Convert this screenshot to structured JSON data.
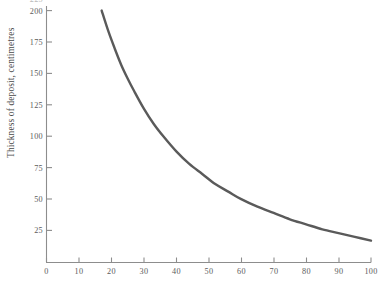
{
  "chart_data": {
    "type": "line",
    "title": "",
    "subtitle": "",
    "xlabel": "",
    "ylabel": "Thickness of deposit, centimetres",
    "xlim": [
      0,
      100
    ],
    "ylim": [
      0,
      200
    ],
    "xticks": [
      0,
      10,
      20,
      30,
      40,
      50,
      60,
      70,
      80,
      90,
      100
    ],
    "xticklabels": [
      "0",
      "10",
      "20",
      "30",
      "40",
      "50",
      "60",
      "70",
      "80",
      "90",
      "100"
    ],
    "yticks": [
      25,
      50,
      75,
      100,
      125,
      150,
      175,
      200
    ],
    "yticklabels": [
      "25",
      "50",
      "75",
      "100",
      "125",
      "150",
      "175",
      "200"
    ],
    "ytick_clipped_top": {
      "value": 225,
      "label": "225",
      "note": "partially cut off at top edge of image"
    },
    "grid": false,
    "legend": null,
    "annotations": [],
    "series": [
      {
        "name": "deposit thickness",
        "color": "#5a5a5a",
        "linewidth": 2.4,
        "x": [
          17,
          19,
          21,
          23,
          25,
          27,
          30,
          33,
          36,
          40,
          44,
          48,
          52,
          56,
          60,
          65,
          70,
          75,
          80,
          85,
          90,
          95,
          100
        ],
        "y": [
          200,
          184,
          170,
          157,
          146,
          136,
          122,
          110,
          100,
          88,
          78,
          70,
          62,
          56,
          50,
          44,
          39,
          34,
          30,
          26,
          23,
          20,
          17
        ]
      }
    ]
  },
  "axes": {
    "y_axis_title": "Thickness of deposit, centimetres",
    "tick_color": "#8d8d8d",
    "axis_color": "#8d8d8d",
    "curve_color": "#5a5a5a",
    "background": "#ffffff"
  }
}
